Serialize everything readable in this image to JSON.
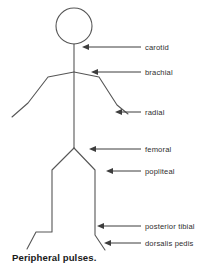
{
  "figure": {
    "caption": "Peripheral pulses.",
    "line_color": "#565656",
    "leader_color": "#3d3d3d",
    "text_color": "#2e2e2e",
    "background": "#ffffff"
  },
  "labels": [
    {
      "id": "carotid",
      "text": "carotid",
      "text_x": 145,
      "text_y": 50,
      "line_x1": 141,
      "line_x2": 86,
      "line_y": 47,
      "tip_x": 82
    },
    {
      "id": "brachial",
      "text": "brachial",
      "text_x": 145,
      "text_y": 75,
      "line_x1": 141,
      "line_x2": 95,
      "line_y": 72,
      "tip_x": 91
    },
    {
      "id": "radial",
      "text": "radial",
      "text_x": 145,
      "text_y": 115,
      "line_x1": 141,
      "line_x2": 119,
      "line_y": 112,
      "tip_x": 115
    },
    {
      "id": "femoral",
      "text": "femoral",
      "text_x": 145,
      "text_y": 152,
      "line_x1": 141,
      "line_x2": 93,
      "line_y": 149,
      "tip_x": 89
    },
    {
      "id": "popliteal",
      "text": "popliteal",
      "text_x": 145,
      "text_y": 174,
      "line_x1": 141,
      "line_x2": 110,
      "line_y": 171,
      "tip_x": 106
    },
    {
      "id": "posterior-tibial",
      "text": "posterior tibial",
      "text_x": 145,
      "text_y": 229,
      "line_x1": 141,
      "line_x2": 101,
      "line_y": 226,
      "tip_x": 97
    },
    {
      "id": "dorsalis-pedis",
      "text": "dorsalis pedis",
      "text_x": 145,
      "text_y": 246,
      "line_x1": 141,
      "line_x2": 108,
      "line_y": 243,
      "tip_x": 104
    }
  ],
  "body": {
    "head": {
      "cx": 74,
      "cy": 26,
      "r": 18
    },
    "neck_torso": "M74,44 L74,148",
    "left_arm": "M74,72 L48,77 L28,103 L12,117",
    "right_arm": "M74,72 L99,77 L117,105 L128,114",
    "left_leg": "M74,148 L52,170 L52,232 L36,232 L27,249",
    "right_leg": "M74,148 L95,170 L95,235 L105,250",
    "left_hip_line": "M74,148 L52,170",
    "right_hip_line": "M74,148 L95,170"
  }
}
